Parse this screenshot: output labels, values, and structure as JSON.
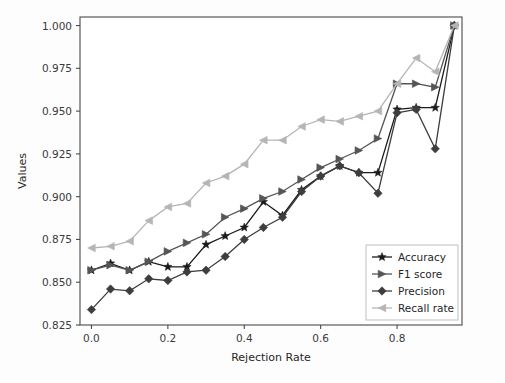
{
  "chart_data": {
    "type": "line",
    "title": "",
    "xlabel": "Rejection Rate",
    "ylabel": "Values",
    "xlim": [
      -0.03,
      0.97
    ],
    "ylim": [
      0.825,
      1.005
    ],
    "xticks": [
      "0.0",
      "0.2",
      "0.4",
      "0.6",
      "0.8"
    ],
    "xtick_values": [
      0.0,
      0.2,
      0.4,
      0.6,
      0.8
    ],
    "yticks": [
      "0.825",
      "0.850",
      "0.875",
      "0.900",
      "0.925",
      "0.950",
      "0.975",
      "1.000"
    ],
    "ytick_values": [
      0.825,
      0.85,
      0.875,
      0.9,
      0.925,
      0.95,
      0.975,
      1.0
    ],
    "grid": false,
    "legend_position": "lower right",
    "x": [
      0.0,
      0.05,
      0.1,
      0.15,
      0.2,
      0.25,
      0.3,
      0.35,
      0.4,
      0.45,
      0.5,
      0.55,
      0.6,
      0.65,
      0.7,
      0.75,
      0.8,
      0.85,
      0.9,
      0.95
    ],
    "series": [
      {
        "name": "Accuracy",
        "color": "#1a1a1a",
        "marker": "star",
        "values": [
          0.857,
          0.861,
          0.857,
          0.862,
          0.859,
          0.859,
          0.872,
          0.877,
          0.882,
          0.897,
          0.889,
          0.904,
          0.912,
          0.918,
          0.914,
          0.914,
          0.951,
          0.952,
          0.952,
          1.0
        ]
      },
      {
        "name": "F1 score",
        "color": "#555555",
        "marker": "triangle-right",
        "values": [
          0.857,
          0.86,
          0.857,
          0.862,
          0.868,
          0.873,
          0.878,
          0.888,
          0.893,
          0.899,
          0.903,
          0.91,
          0.917,
          0.922,
          0.927,
          0.934,
          0.966,
          0.966,
          0.964,
          1.0
        ]
      },
      {
        "name": "Precision",
        "color": "#3d3d3d",
        "marker": "diamond",
        "values": [
          0.834,
          0.846,
          0.845,
          0.852,
          0.851,
          0.856,
          0.857,
          0.865,
          0.875,
          0.882,
          0.888,
          0.903,
          0.912,
          0.918,
          0.914,
          0.902,
          0.949,
          0.951,
          0.928,
          1.0
        ]
      },
      {
        "name": "Recall rate",
        "color": "#b5b5b5",
        "marker": "triangle-left",
        "values": [
          0.87,
          0.871,
          0.874,
          0.886,
          0.894,
          0.896,
          0.908,
          0.912,
          0.919,
          0.933,
          0.933,
          0.941,
          0.945,
          0.944,
          0.947,
          0.95,
          0.966,
          0.981,
          0.973,
          1.0
        ]
      }
    ]
  },
  "legend": {
    "items": [
      {
        "label": "Accuracy"
      },
      {
        "label": "F1 score"
      },
      {
        "label": "Precision"
      },
      {
        "label": "Recall rate"
      }
    ]
  }
}
